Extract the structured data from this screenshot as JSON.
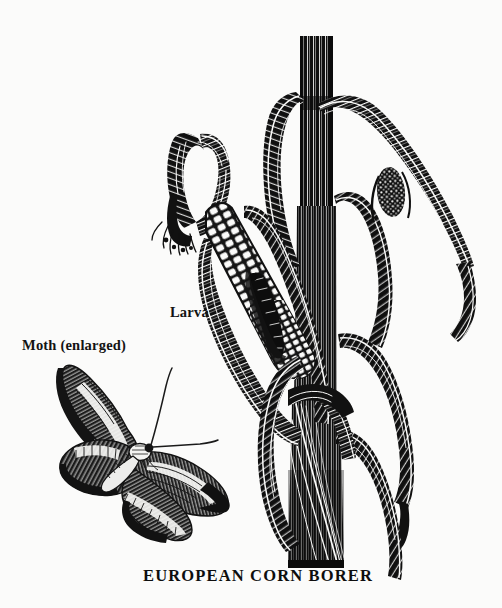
{
  "plate": {
    "background_color": "#fbfbfa",
    "ink_color": "#111111",
    "width": 502,
    "height": 608,
    "medium": "black-and-white woodcut engraving",
    "caption": "EUROPEAN CORN BORER"
  },
  "labels": {
    "moth": "Moth (enlarged)",
    "larva": "Larva"
  },
  "figures": [
    {
      "name": "corn-plant",
      "description": "Corn stalk with husked ear, leaves and silk tassels"
    },
    {
      "name": "corn-ear",
      "description": "Opened ear of corn showing checkered kernels with husk curling over the tip"
    },
    {
      "name": "larva",
      "description": "Dark caterpillar boring into the corn kernels"
    },
    {
      "name": "moth",
      "description": "Enlarged adult moth with banded wings and two long antennae"
    }
  ]
}
